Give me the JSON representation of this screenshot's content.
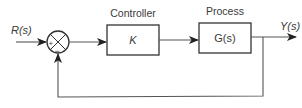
{
  "diagram": {
    "type": "closed-loop control block diagram",
    "input": {
      "label": "R(s)"
    },
    "summing_junction": {
      "plus_sign": "+",
      "minus_sign": "−"
    },
    "controller": {
      "title": "Controller",
      "transfer_function": "K"
    },
    "process": {
      "title": "Process",
      "transfer_function": "G(s)"
    },
    "output": {
      "label": "Y(s)"
    },
    "feedback": {
      "type": "unity negative feedback"
    },
    "colors": {
      "line": "#555555",
      "box_border": "#333333",
      "text": "#3a3a3a"
    }
  }
}
